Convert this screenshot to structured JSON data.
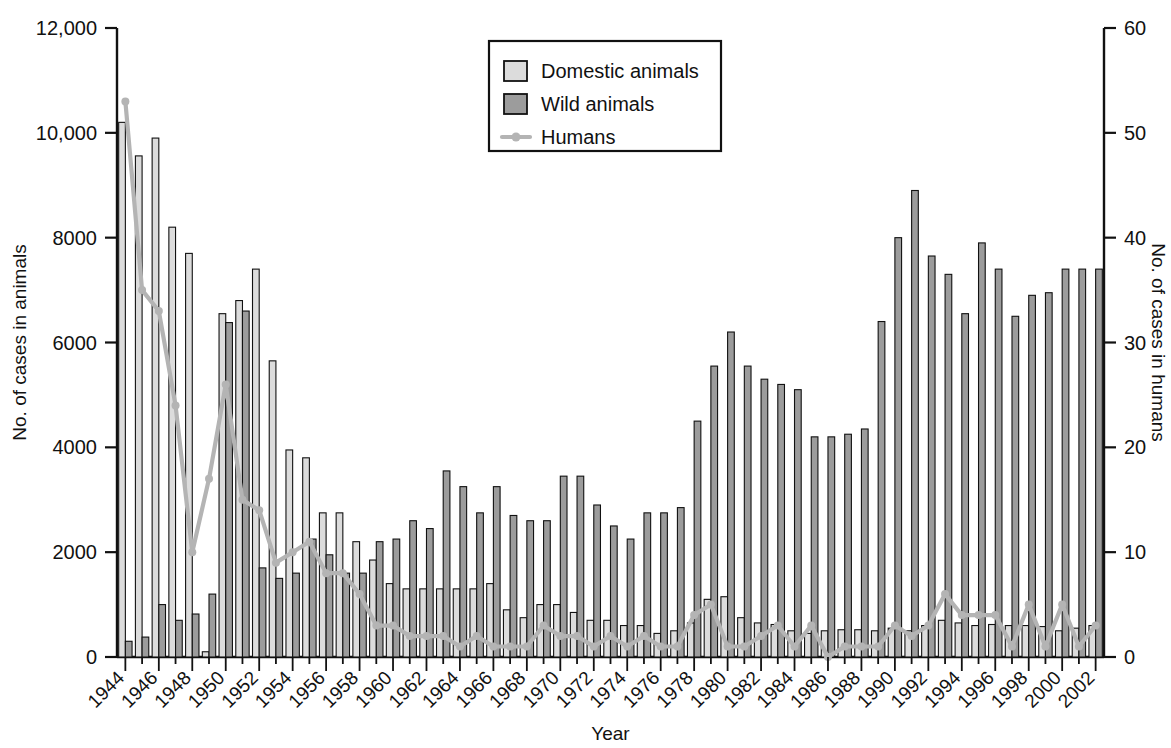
{
  "chart_data": {
    "type": "bar",
    "title": "",
    "xlabel": "Year",
    "ylabel": "No. of cases in animals",
    "y2label": "No. of cases in humans",
    "ylim": [
      0,
      12000
    ],
    "y2lim": [
      0,
      60
    ],
    "grid": false,
    "legend_position": "top-center",
    "y_ticks": [
      "0",
      "2000",
      "4000",
      "6000",
      "8000",
      "10,000",
      "12,000"
    ],
    "y_tick_values": [
      0,
      2000,
      4000,
      6000,
      8000,
      10000,
      12000
    ],
    "y2_ticks": [
      "0",
      "10",
      "20",
      "30",
      "40",
      "50",
      "60"
    ],
    "y2_tick_values": [
      0,
      10,
      20,
      30,
      40,
      50,
      60
    ],
    "x_tick_labels": [
      "1944",
      "1946",
      "1948",
      "1950",
      "1952",
      "1954",
      "1956",
      "1958",
      "1960",
      "1962",
      "1964",
      "1966",
      "1968",
      "1970",
      "1972",
      "1974",
      "1976",
      "1978",
      "1980",
      "1982",
      "1984",
      "1986",
      "1988",
      "1990",
      "1992",
      "1994",
      "1996",
      "1998",
      "2000",
      "2002"
    ],
    "categories": [
      1944,
      1945,
      1946,
      1947,
      1948,
      1949,
      1950,
      1951,
      1952,
      1953,
      1954,
      1955,
      1956,
      1957,
      1958,
      1959,
      1960,
      1961,
      1962,
      1963,
      1964,
      1965,
      1966,
      1967,
      1968,
      1969,
      1970,
      1971,
      1972,
      1973,
      1974,
      1975,
      1976,
      1977,
      1978,
      1979,
      1980,
      1981,
      1982,
      1983,
      1984,
      1985,
      1986,
      1987,
      1988,
      1989,
      1990,
      1991,
      1992,
      1993,
      1994,
      1995,
      1996,
      1997,
      1998,
      1999,
      2000,
      2001,
      2002
    ],
    "series": [
      {
        "name": "Domestic animals",
        "color": "#dcdcdc",
        "axis": "left",
        "values": [
          10200,
          9560,
          9900,
          8200,
          7700,
          100,
          6550,
          6800,
          7400,
          5650,
          3950,
          3800,
          2750,
          2750,
          2200,
          1850,
          1400,
          1300,
          1300,
          1300,
          1300,
          1300,
          1400,
          900,
          750,
          1000,
          1000,
          850,
          700,
          700,
          600,
          600,
          450,
          500,
          650,
          1100,
          1150,
          750,
          650,
          620,
          500,
          450,
          500,
          520,
          520,
          500,
          550,
          500,
          600,
          700,
          650,
          600,
          620,
          600,
          600,
          580,
          500,
          550,
          600
        ]
      },
      {
        "name": "Wild animals",
        "color": "#9c9c9c",
        "axis": "left",
        "values": [
          300,
          380,
          1000,
          700,
          820,
          1200,
          6380,
          6600,
          1700,
          1500,
          1600,
          2250,
          1950,
          1600,
          1600,
          2200,
          2250,
          2600,
          2450,
          3550,
          3250,
          2750,
          3250,
          2700,
          2600,
          2600,
          3450,
          3450,
          2900,
          2500,
          2250,
          2750,
          2750,
          2850,
          4500,
          5550,
          6200,
          5550,
          5300,
          5200,
          5100,
          4200,
          4200,
          4250,
          4350,
          6400,
          8000,
          8900,
          7650,
          7300,
          6550,
          7900,
          7400,
          6500,
          6900,
          6950,
          7400,
          7400,
          7400
        ]
      },
      {
        "name": "Humans",
        "color": "#b4b4b4",
        "axis": "right",
        "values": [
          53,
          35,
          33,
          24,
          10,
          17,
          26,
          15,
          14,
          9,
          10,
          11,
          8,
          8,
          6,
          3,
          3,
          2,
          2,
          2,
          1,
          2,
          1,
          1,
          1,
          3,
          2,
          2,
          1,
          2,
          1,
          2,
          1,
          1,
          4,
          5,
          1,
          1,
          2,
          3,
          1,
          3,
          0,
          1,
          1,
          1,
          3,
          2,
          3,
          6,
          4,
          4,
          4,
          1,
          5,
          1,
          5,
          1,
          3
        ]
      }
    ],
    "legend_entries": [
      {
        "label": "Domestic animals",
        "type": "swatch",
        "color": "#dcdcdc"
      },
      {
        "label": "Wild animals",
        "type": "swatch",
        "color": "#9c9c9c"
      },
      {
        "label": "Humans",
        "type": "line",
        "color": "#b4b4b4"
      }
    ]
  }
}
